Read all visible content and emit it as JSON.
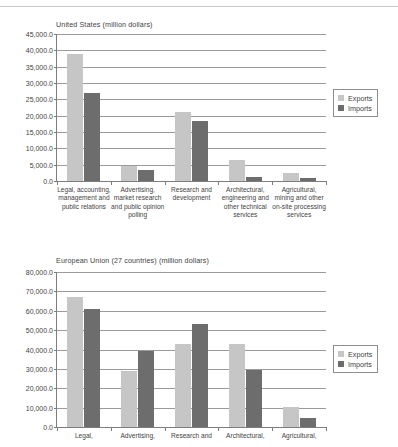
{
  "chart_data": [
    {
      "type": "bar",
      "id": "united-states",
      "title": "United States (million dollars)",
      "xlabel": "",
      "ylabel": "",
      "ylim": [
        0,
        45000
      ],
      "ytick_step": 5000,
      "grid": true,
      "legend_position": "right",
      "ytick_labels": [
        "0.0",
        "5,000.0",
        "10,000.0",
        "15,000.0",
        "20,000.0",
        "25,000.0",
        "30,000.0",
        "35,000.0",
        "40,000.0",
        "45,000.0"
      ],
      "categories": [
        "Legal, accounting, management and public relations",
        "Advertising, market research and public opinion polling",
        "Research and development",
        "Architectural, engineering and other technical services",
        "Agricultural, mining and other on-site processing services"
      ],
      "series": [
        {
          "name": "Exports",
          "color": "#c6c6c6",
          "values": [
            39000,
            4500,
            21000,
            6300,
            2400
          ]
        },
        {
          "name": "Imports",
          "color": "#6d6d6d",
          "values": [
            27000,
            3300,
            18500,
            1200,
            800
          ]
        }
      ]
    },
    {
      "type": "bar",
      "id": "european-union",
      "title": "European Union (27 countries) (million dollars)",
      "xlabel": "",
      "ylabel": "",
      "ylim": [
        0,
        80000
      ],
      "ytick_step": 10000,
      "grid": true,
      "legend_position": "right",
      "ytick_labels": [
        "0.0",
        "10,000.0",
        "20,000.0",
        "30,000.0",
        "40,000.0",
        "50,000.0",
        "60,000.0",
        "70,000.0",
        "80,000.0"
      ],
      "categories": [
        "Legal,",
        "Advertising,",
        "Research and",
        "Architectural,",
        "Agricultural,"
      ],
      "series": [
        {
          "name": "Exports",
          "color": "#c6c6c6",
          "values": [
            67000,
            29000,
            43000,
            43000,
            10500
          ]
        },
        {
          "name": "Imports",
          "color": "#6d6d6d",
          "values": [
            61000,
            39000,
            53000,
            29500,
            4800
          ]
        }
      ]
    }
  ]
}
